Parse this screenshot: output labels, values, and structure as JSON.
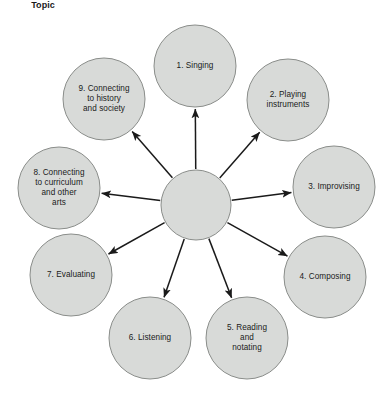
{
  "diagram": {
    "type": "radial-hub-and-spoke",
    "background_color": "#ffffff",
    "node_fill_color": "#d8dad8",
    "node_stroke_color": "#8a8d8a",
    "arrow_color": "#1a1a1a",
    "hub": {
      "id": "hub-topic",
      "label": "Topic",
      "cx": 196,
      "cy": 205,
      "r": 35
    },
    "nodes": [
      {
        "id": "node-1-singing",
        "label": "1. Singing",
        "number": "1",
        "name": "Singing",
        "cx": 195,
        "cy": 66,
        "r": 41,
        "label_x": 195,
        "label_y": 66
      },
      {
        "id": "node-2-playing-instruments",
        "label": "2. Playing\ninstruments",
        "number": "2",
        "name": "Playing instruments",
        "cx": 288,
        "cy": 100,
        "r": 41,
        "label_x": 288,
        "label_y": 100
      },
      {
        "id": "node-3-improvising",
        "label": "3. Improvising",
        "number": "3",
        "name": "Improvising",
        "cx": 334,
        "cy": 187,
        "r": 41,
        "label_x": 334,
        "label_y": 187
      },
      {
        "id": "node-4-composing",
        "label": "4. Composing",
        "number": "4",
        "name": "Composing",
        "cx": 325,
        "cy": 277,
        "r": 41,
        "label_x": 325,
        "label_y": 277
      },
      {
        "id": "node-5-reading-and-notating",
        "label": "5. Reading\nand\nnotating",
        "number": "5",
        "name": "Reading and notating",
        "cx": 247,
        "cy": 338,
        "r": 41,
        "label_x": 247,
        "label_y": 338
      },
      {
        "id": "node-6-listening",
        "label": "6. Listening",
        "number": "6",
        "name": "Listening",
        "cx": 150,
        "cy": 338,
        "r": 41,
        "label_x": 150,
        "label_y": 338
      },
      {
        "id": "node-7-evaluating",
        "label": "7. Evaluating",
        "number": "7",
        "name": "Evaluating",
        "cx": 71,
        "cy": 275,
        "r": 41,
        "label_x": 71,
        "label_y": 275
      },
      {
        "id": "node-8-connecting-curriculum",
        "label": "8. Connecting\nto curriculum\nand other\narts",
        "number": "8",
        "name": "Connecting to curriculum and other arts",
        "cx": 59,
        "cy": 188,
        "r": 41,
        "label_x": 59,
        "label_y": 188
      },
      {
        "id": "node-9-connecting-history",
        "label": "9. Connecting\nto history\nand society",
        "number": "9",
        "name": "Connecting to history and society",
        "cx": 104,
        "cy": 99,
        "r": 41,
        "label_x": 104,
        "label_y": 99
      }
    ]
  }
}
